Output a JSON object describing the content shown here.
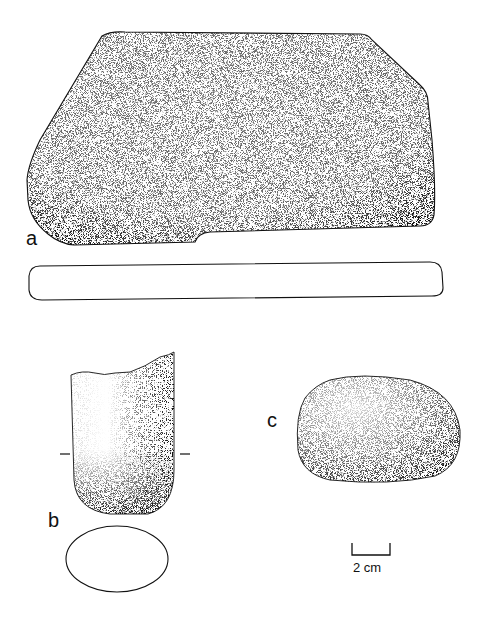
{
  "figure": {
    "background": "#ffffff",
    "ink_color": "#111111",
    "items": [
      {
        "label": "a",
        "description": "grinding slab, plan view with stippled surface and profile section below"
      },
      {
        "label": "b",
        "description": "pestle fragment, side view with section marks and oval cross-section below"
      },
      {
        "label": "c",
        "description": "rounded hammerstone / handstone, stippled"
      }
    ],
    "scale_bar": {
      "text": "2 cm"
    }
  }
}
